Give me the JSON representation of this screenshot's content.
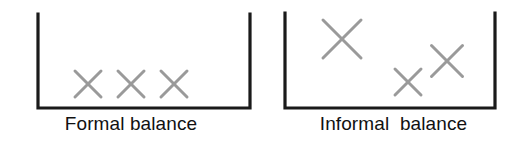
{
  "figure": {
    "width": 525,
    "height": 144,
    "background": "#ffffff",
    "bracket_color": "#1a1a1a",
    "mark_color": "#9a9a9a",
    "text_color": "#111111"
  },
  "panels": [
    {
      "id": "formal",
      "caption": "Formal balance",
      "bracket": {
        "left": 38,
        "right": 250,
        "top": 14,
        "bottom": 108,
        "stroke_width": 3.2
      },
      "marks": [
        {
          "name": "x-mark",
          "cx": 88,
          "cy": 84,
          "size": 26,
          "stroke": 3.0
        },
        {
          "name": "x-mark",
          "cx": 131,
          "cy": 84,
          "size": 26,
          "stroke": 3.0
        },
        {
          "name": "x-mark",
          "cx": 174,
          "cy": 84,
          "size": 26,
          "stroke": 3.0
        }
      ]
    },
    {
      "id": "informal",
      "caption": "Informal  balance",
      "bracket": {
        "left": 23,
        "right": 233,
        "top": 13,
        "bottom": 108,
        "stroke_width": 3.2
      },
      "marks": [
        {
          "name": "x-mark",
          "cx": 80,
          "cy": 39,
          "size": 38,
          "stroke": 3.0
        },
        {
          "name": "x-mark",
          "cx": 146,
          "cy": 82,
          "size": 26,
          "stroke": 3.0
        },
        {
          "name": "x-mark",
          "cx": 185,
          "cy": 61,
          "size": 31,
          "stroke": 3.0
        }
      ]
    }
  ]
}
